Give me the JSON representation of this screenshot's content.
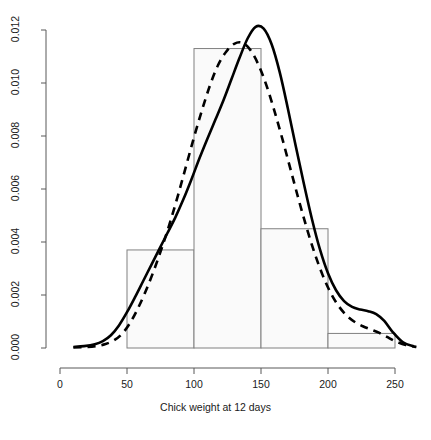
{
  "chart_data": {
    "type": "histogram+density",
    "title": "",
    "subtitle": "",
    "xlabel": "Chick weight at 12 days",
    "ylabel": "",
    "xlim": [
      0,
      260
    ],
    "ylim": [
      0,
      0.0126
    ],
    "grid": false,
    "legend": "none",
    "xticks": [
      "0",
      "50",
      "100",
      "150",
      "200",
      "250"
    ],
    "xtick_values": [
      0,
      50,
      100,
      150,
      200,
      250
    ],
    "yticks": [
      "0.000",
      "0.002",
      "0.004",
      "0.006",
      "0.008",
      "0.010",
      "0.012"
    ],
    "ytick_values": [
      0.0,
      0.002,
      0.004,
      0.006,
      0.008,
      0.01,
      0.012
    ],
    "histogram": {
      "bin_edges": [
        50,
        100,
        150,
        200,
        250
      ],
      "densities": [
        0.0037,
        0.0113,
        0.0045,
        0.00055
      ],
      "bar_fill": "#fafafa",
      "bar_stroke": "#808080"
    },
    "series": [
      {
        "name": "density-solid",
        "style": "solid",
        "color": "#000000",
        "width": 2.6,
        "x": [
          10,
          18,
          26,
          32,
          38,
          44,
          50,
          56,
          62,
          68,
          74,
          80,
          86,
          92,
          98,
          104,
          110,
          116,
          122,
          128,
          134,
          140,
          146,
          152,
          158,
          164,
          170,
          176,
          182,
          188,
          194,
          200,
          206,
          212,
          218,
          224,
          230,
          236,
          242,
          248,
          256,
          264
        ],
        "y": [
          4e-05,
          7e-05,
          0.00014,
          0.00026,
          0.00048,
          0.00085,
          0.00135,
          0.00192,
          0.00252,
          0.00312,
          0.00372,
          0.00432,
          0.00492,
          0.0056,
          0.00635,
          0.00715,
          0.0079,
          0.00862,
          0.00935,
          0.01015,
          0.01095,
          0.01168,
          0.01212,
          0.01205,
          0.01145,
          0.0104,
          0.00905,
          0.0076,
          0.0062,
          0.00487,
          0.00372,
          0.00282,
          0.00218,
          0.00177,
          0.00155,
          0.00145,
          0.00139,
          0.00128,
          0.00102,
          0.00062,
          0.00021,
          6e-05
        ]
      },
      {
        "name": "density-dashed",
        "style": "dashed",
        "color": "#000000",
        "width": 2.6,
        "x": [
          10,
          20,
          28,
          34,
          40,
          46,
          52,
          58,
          64,
          70,
          76,
          82,
          88,
          94,
          100,
          106,
          112,
          118,
          124,
          130,
          136,
          142,
          148,
          154,
          160,
          166,
          172,
          178,
          184,
          190,
          196,
          202,
          208,
          214,
          220,
          226,
          232,
          238,
          244,
          250,
          258,
          266
        ],
        "y": [
          2e-05,
          4e-05,
          8e-05,
          0.00015,
          0.00028,
          0.00052,
          0.00092,
          0.00148,
          0.00215,
          0.00292,
          0.00378,
          0.00472,
          0.00575,
          0.00685,
          0.00795,
          0.00898,
          0.00992,
          0.01068,
          0.01118,
          0.01148,
          0.01152,
          0.01125,
          0.0107,
          0.00992,
          0.00895,
          0.00788,
          0.00675,
          0.00562,
          0.00455,
          0.00358,
          0.00275,
          0.00208,
          0.00158,
          0.00122,
          0.00098,
          0.00082,
          0.0007,
          0.00058,
          0.00042,
          0.00026,
          0.00011,
          4e-05
        ]
      }
    ]
  },
  "axes": {
    "x_tick_labels": [
      "0",
      "50",
      "100",
      "150",
      "200",
      "250"
    ],
    "y_tick_labels": [
      "0.000",
      "0.002",
      "0.004",
      "0.006",
      "0.008",
      "0.010",
      "0.012"
    ],
    "x_axis_title": "Chick weight at 12 days"
  }
}
